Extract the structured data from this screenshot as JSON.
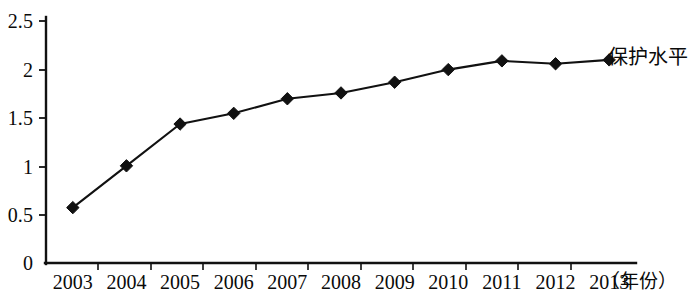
{
  "chart_data": {
    "type": "line",
    "title": "",
    "subtitle": "",
    "xlabel": "（年份）",
    "ylabel": "",
    "categories": [
      "2003",
      "2004",
      "2005",
      "2006",
      "2007",
      "2008",
      "2009",
      "2010",
      "2011",
      "2012",
      "2013"
    ],
    "series": [
      {
        "name": "保护水平",
        "values": [
          0.58,
          1.01,
          1.44,
          1.55,
          1.7,
          1.76,
          1.87,
          2.0,
          2.09,
          2.06,
          2.1
        ],
        "marker": "filled-diamond",
        "color": "#111111"
      }
    ],
    "ylim": [
      0,
      2.5
    ],
    "ytick_values": [
      0,
      0.5,
      1,
      1.5,
      2,
      2.5
    ],
    "ytick_labels": [
      "0",
      "0.5",
      "1",
      "1.5",
      "2",
      "2.5"
    ],
    "grid": false,
    "legend": "inline-right-of-last-point",
    "legend_entries": [
      "保护水平"
    ],
    "axis_color": "#111111",
    "background": "#ffffff"
  },
  "axis": {
    "y_label_0": "0",
    "y_label_1": "0.5",
    "y_label_2": "1",
    "y_label_3": "1.5",
    "y_label_4": "2",
    "y_label_5": "2.5",
    "x_unit": "（年份）"
  },
  "series_label": {
    "text": "保护水平"
  }
}
